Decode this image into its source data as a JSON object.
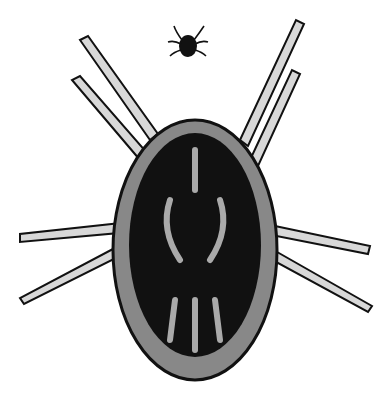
{
  "image": {
    "subject": "engraving of a mite/tick, enlarged view with small actual-size specimen above",
    "background": "#ffffff",
    "ink": "#111111",
    "leg_fill": "#d8d8d8"
  }
}
